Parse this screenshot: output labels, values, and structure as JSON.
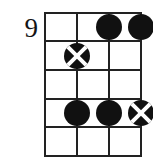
{
  "diagram": {
    "kind": "guitar-chord-diagram",
    "fret_number_label": "9",
    "strings": 4,
    "frets": 5,
    "geometry": {
      "grid_left": 44,
      "grid_top": 12,
      "string_spacing": 32,
      "fret_spacing": 28.6,
      "marker_diameter": 26,
      "line_color": "#222222",
      "marker_fill": "#111111",
      "marker_cross_color": "#ffffff",
      "background": "#ffffff",
      "text_color": "#141414"
    },
    "string_lines": [
      {
        "name": "string-1",
        "x": 44
      },
      {
        "name": "string-2",
        "x": 76
      },
      {
        "name": "string-3",
        "x": 108
      },
      {
        "name": "string-4",
        "x": 140
      }
    ],
    "fret_lines": [
      {
        "name": "fret-line-0",
        "y": 12
      },
      {
        "name": "fret-line-1",
        "y": 40
      },
      {
        "name": "fret-line-2",
        "y": 69
      },
      {
        "name": "fret-line-3",
        "y": 98
      },
      {
        "name": "fret-line-4",
        "y": 126
      },
      {
        "name": "fret-line-5",
        "y": 155
      }
    ],
    "markers": [
      {
        "id": "m1",
        "type": "filled",
        "string": 3,
        "fret": 1,
        "cx": 108,
        "cy": 26
      },
      {
        "id": "m2",
        "type": "filled",
        "string": 4,
        "fret": 1,
        "cx": 140,
        "cy": 26
      },
      {
        "id": "m3",
        "type": "crossed",
        "string": 2,
        "fret": 2,
        "cx": 76,
        "cy": 55
      },
      {
        "id": "m4",
        "type": "filled",
        "string": 2,
        "fret": 4,
        "cx": 76,
        "cy": 112
      },
      {
        "id": "m5",
        "type": "filled",
        "string": 3,
        "fret": 4,
        "cx": 108,
        "cy": 112
      },
      {
        "id": "m6",
        "type": "crossed",
        "string": 4,
        "fret": 4,
        "cx": 140,
        "cy": 112
      }
    ]
  }
}
